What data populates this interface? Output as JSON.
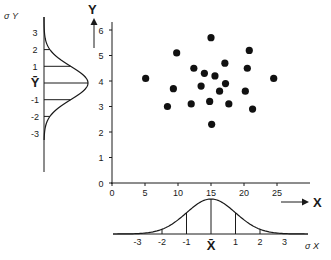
{
  "chart_data": {
    "type": "scatter",
    "title": "",
    "xlabel": "X",
    "ylabel": "Y",
    "xlim": [
      0,
      30
    ],
    "ylim": [
      0,
      6.3
    ],
    "xticks": [
      "0",
      "5",
      "10",
      "15",
      "20",
      "25"
    ],
    "yticks": [
      "0",
      "1",
      "2",
      "3",
      "4",
      "5",
      "6"
    ],
    "points": [
      {
        "x": 5.1,
        "y": 4.1
      },
      {
        "x": 8.4,
        "y": 3.0
      },
      {
        "x": 9.3,
        "y": 3.7
      },
      {
        "x": 9.8,
        "y": 5.1
      },
      {
        "x": 12.0,
        "y": 3.1
      },
      {
        "x": 12.4,
        "y": 4.5
      },
      {
        "x": 13.5,
        "y": 3.8
      },
      {
        "x": 14.0,
        "y": 4.3
      },
      {
        "x": 14.8,
        "y": 3.2
      },
      {
        "x": 15.0,
        "y": 5.7
      },
      {
        "x": 15.1,
        "y": 2.3
      },
      {
        "x": 15.6,
        "y": 4.2
      },
      {
        "x": 16.3,
        "y": 3.6
      },
      {
        "x": 17.1,
        "y": 4.7
      },
      {
        "x": 17.2,
        "y": 3.9
      },
      {
        "x": 17.7,
        "y": 3.1
      },
      {
        "x": 20.2,
        "y": 3.6
      },
      {
        "x": 20.5,
        "y": 4.5
      },
      {
        "x": 20.8,
        "y": 5.2
      },
      {
        "x": 21.3,
        "y": 2.9
      },
      {
        "x": 24.5,
        "y": 4.1
      }
    ],
    "marginal_x": {
      "label": "X",
      "sigma_label": "σ X",
      "mean_label": "X̄",
      "sigma_ticks": [
        "-3",
        "-2",
        "-1",
        "X̄",
        "1",
        "2",
        "3"
      ],
      "mean": 15,
      "sd": 3.7
    },
    "marginal_y": {
      "label": "Y",
      "sigma_label": "σ Y",
      "mean_label": "Ȳ",
      "sigma_ticks": [
        "3",
        "2",
        "1",
        "Ȳ",
        "-1",
        "-2",
        "-3"
      ],
      "mean": 4,
      "sd": 0.7
    }
  },
  "labels": {
    "x_axis": "X",
    "y_axis": "Y",
    "sigma_x": "σ X",
    "sigma_y": "σ Y"
  }
}
